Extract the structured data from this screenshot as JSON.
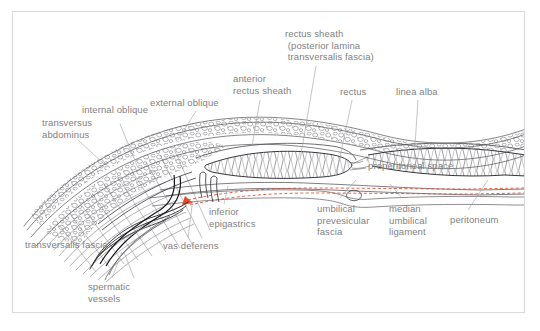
{
  "figure": {
    "kind": "anatomical-line-diagram",
    "background_color": "#ffffff",
    "frame_color": "#d9d9dc",
    "label_color": "#818184",
    "line_color": "#6e6e73",
    "ink_color": "#1a1a1a",
    "accent_color": "#e8492b"
  },
  "labels": [
    {
      "id": "transversus-abdominus",
      "text": "transversus\nabdominus",
      "x": 42,
      "y": 117,
      "align": "left"
    },
    {
      "id": "internal-oblique",
      "text": "internal oblique",
      "x": 82,
      "y": 113,
      "align": "left"
    },
    {
      "id": "external-oblique",
      "text": "external oblique",
      "x": 150,
      "y": 100,
      "align": "left"
    },
    {
      "id": "anterior-rectus-sheath",
      "text": "anterior\nrectus sheath",
      "x": 233,
      "y": 75,
      "align": "left"
    },
    {
      "id": "rectus-sheath",
      "text": "rectus sheath\n (posterior lamina\n transversalis fascia)",
      "x": 285,
      "y": 30,
      "align": "left"
    },
    {
      "id": "rectus",
      "text": "rectus",
      "x": 340,
      "y": 89,
      "align": "left"
    },
    {
      "id": "linea-alba",
      "text": "linea alba",
      "x": 397,
      "y": 89,
      "align": "left"
    },
    {
      "id": "preperitoneal-space",
      "text": "preperitoneal space",
      "x": 368,
      "y": 161,
      "align": "left"
    },
    {
      "id": "peritoneum",
      "text": "peritoneum",
      "x": 450,
      "y": 216,
      "align": "left"
    },
    {
      "id": "median-umbilical-ligament",
      "text": "median\numbilical\nligament",
      "x": 389,
      "y": 204,
      "align": "left"
    },
    {
      "id": "umbilical-prevesicular-fascia",
      "text": "umbilical\nprevesicular\nfascia",
      "x": 317,
      "y": 204,
      "align": "left"
    },
    {
      "id": "inferior-epigastrics",
      "text": "inferior\nepigastrics",
      "x": 209,
      "y": 207,
      "align": "left"
    },
    {
      "id": "vas-deferens",
      "text": "vas deferens",
      "x": 163,
      "y": 243,
      "align": "left"
    },
    {
      "id": "transversalis-fascia",
      "text": "transversalis fascia",
      "x": 25,
      "y": 241,
      "align": "left"
    },
    {
      "id": "spermatic-vessels",
      "text": "spermatic\nvessels",
      "x": 88,
      "y": 283,
      "align": "left"
    }
  ]
}
